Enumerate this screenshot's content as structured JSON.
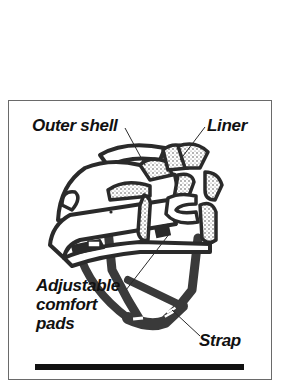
{
  "figure": {
    "labels": {
      "outer_shell": "Outer shell",
      "liner": "Liner",
      "adjustable_line1": "Adjustable",
      "adjustable_line2": "comfort",
      "adjustable_line3": "pads",
      "strap": "Strap"
    },
    "colors": {
      "ink": "#2a2a2a",
      "text": "#111111",
      "frame": "#6a6a6a",
      "background": "#ffffff",
      "strap": "#3a3a3a"
    }
  }
}
